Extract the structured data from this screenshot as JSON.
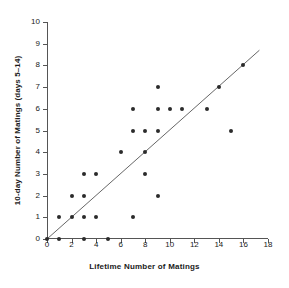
{
  "chart_data": {
    "type": "scatter",
    "title": "",
    "xlabel": "Lifetime Number of Matings",
    "ylabel": "10-day Number of Matings (days 5–14)",
    "xlim": [
      0,
      18
    ],
    "ylim": [
      0,
      10
    ],
    "xticks": [
      0,
      2,
      4,
      6,
      8,
      10,
      12,
      14,
      16,
      18
    ],
    "yticks": [
      0,
      1,
      2,
      3,
      4,
      5,
      6,
      7,
      8,
      9,
      10
    ],
    "xtick_labels": [
      "0",
      "2",
      "4",
      "6",
      "8",
      "10",
      "12",
      "14",
      "16",
      "18"
    ],
    "ytick_labels": [
      "0",
      "1",
      "2",
      "3",
      "4",
      "5",
      "6",
      "7",
      "8",
      "9",
      "10"
    ],
    "grid": false,
    "legend": null,
    "marker_color": "#2b2b2b",
    "line_color": "#555555",
    "axis_color": "#555555",
    "points": [
      {
        "x": 0,
        "y": 0
      },
      {
        "x": 1,
        "y": 0
      },
      {
        "x": 3,
        "y": 0
      },
      {
        "x": 5,
        "y": 0
      },
      {
        "x": 1,
        "y": 1
      },
      {
        "x": 2,
        "y": 1
      },
      {
        "x": 3,
        "y": 1
      },
      {
        "x": 4,
        "y": 1
      },
      {
        "x": 7,
        "y": 1
      },
      {
        "x": 2,
        "y": 2
      },
      {
        "x": 3,
        "y": 2
      },
      {
        "x": 9,
        "y": 2
      },
      {
        "x": 3,
        "y": 3
      },
      {
        "x": 4,
        "y": 3
      },
      {
        "x": 8,
        "y": 3
      },
      {
        "x": 6,
        "y": 4
      },
      {
        "x": 8,
        "y": 4
      },
      {
        "x": 7,
        "y": 5
      },
      {
        "x": 8,
        "y": 5
      },
      {
        "x": 9,
        "y": 5
      },
      {
        "x": 15,
        "y": 5
      },
      {
        "x": 7,
        "y": 6
      },
      {
        "x": 9,
        "y": 6
      },
      {
        "x": 10,
        "y": 6
      },
      {
        "x": 11,
        "y": 6
      },
      {
        "x": 13,
        "y": 6
      },
      {
        "x": 9,
        "y": 7
      },
      {
        "x": 14,
        "y": 7
      },
      {
        "x": 16,
        "y": 8
      }
    ],
    "reference_line": {
      "label": "reference line",
      "x0": 0,
      "y0": 0,
      "x1": 17.3,
      "y1": 8.7
    }
  }
}
